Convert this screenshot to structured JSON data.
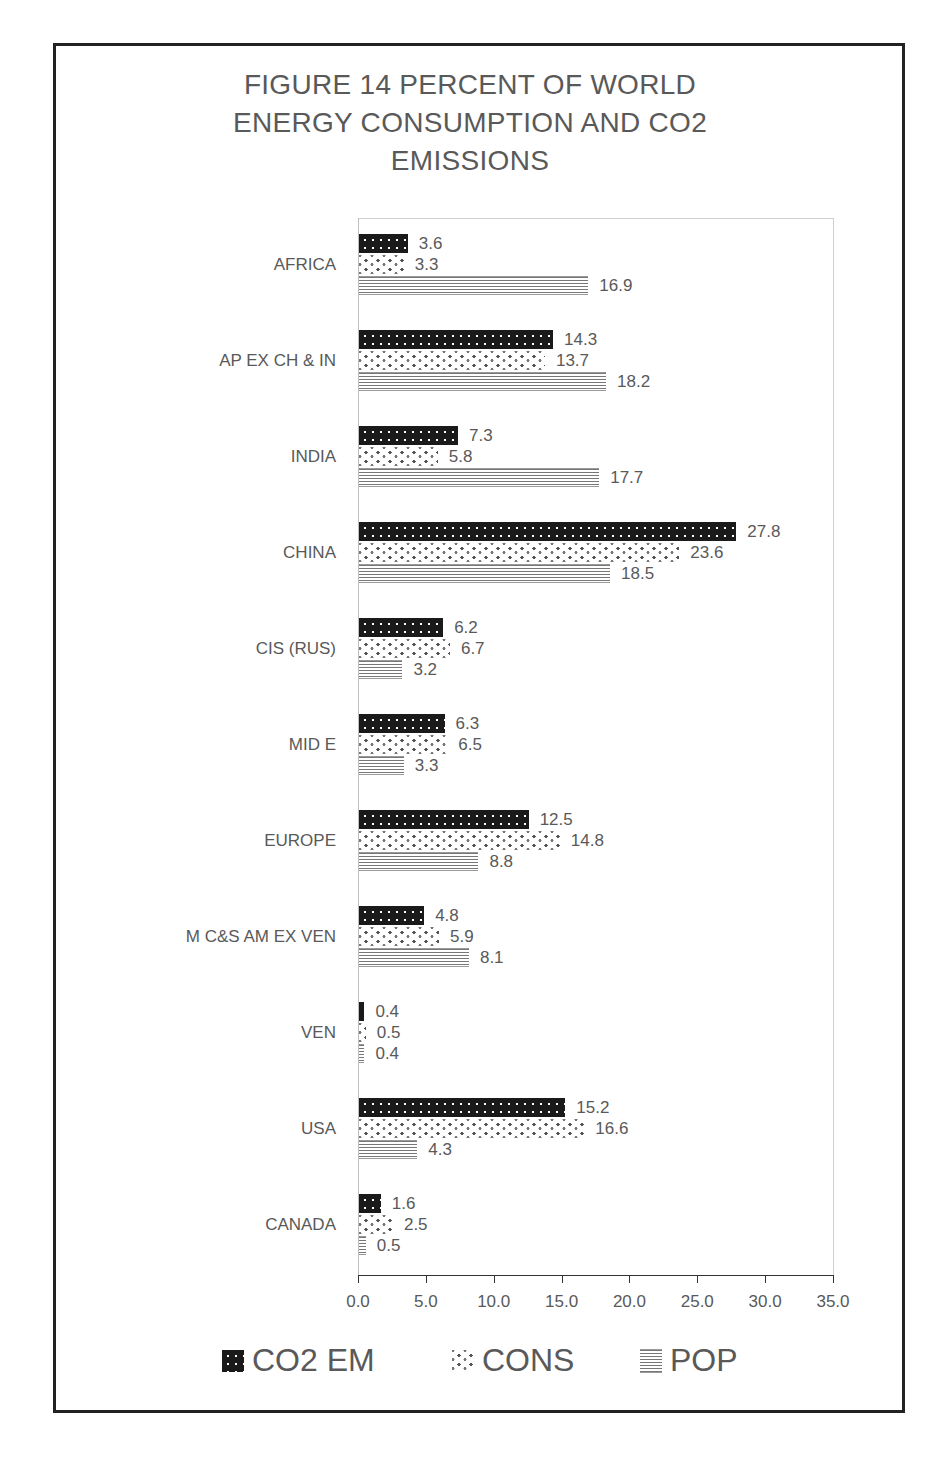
{
  "chart_data": {
    "type": "bar",
    "orientation": "horizontal",
    "title": "FIGURE 14 PERCENT OF WORLD ENERGY CONSUMPTION AND CO2 EMISSIONS",
    "title_lines": [
      "FIGURE 14 PERCENT OF WORLD",
      "ENERGY CONSUMPTION AND CO2",
      "EMISSIONS"
    ],
    "categories": [
      "AFRICA",
      "AP EX CH & IN",
      "INDIA",
      "CHINA",
      "CIS (RUS)",
      "MID E",
      "EUROPE",
      "M  C&S AM EX VEN",
      "VEN",
      "USA",
      "CANADA"
    ],
    "series": [
      {
        "name": "CO2 EM",
        "pattern": "dark-dotted",
        "values": [
          3.6,
          14.3,
          7.3,
          27.8,
          6.2,
          6.3,
          12.5,
          4.8,
          0.4,
          15.2,
          1.6
        ]
      },
      {
        "name": "CONS",
        "pattern": "checker-dots",
        "values": [
          3.3,
          13.7,
          5.8,
          23.6,
          6.7,
          6.5,
          14.8,
          5.9,
          0.5,
          16.6,
          2.5
        ]
      },
      {
        "name": "POP",
        "pattern": "horizontal-lines",
        "values": [
          16.9,
          18.2,
          17.7,
          18.5,
          3.2,
          3.3,
          8.8,
          8.1,
          0.4,
          4.3,
          0.5
        ]
      }
    ],
    "xlabel": "",
    "ylabel": "",
    "xlim": [
      0,
      35
    ],
    "xticks": [
      "0.0",
      "5.0",
      "10.0",
      "15.0",
      "20.0",
      "25.0",
      "30.0",
      "35.0"
    ],
    "grid": false,
    "data_labels": true,
    "legend_position": "bottom"
  },
  "colors": {
    "text": "#595959",
    "co2_fill": "#1a1a1a",
    "frame": "#222222"
  }
}
